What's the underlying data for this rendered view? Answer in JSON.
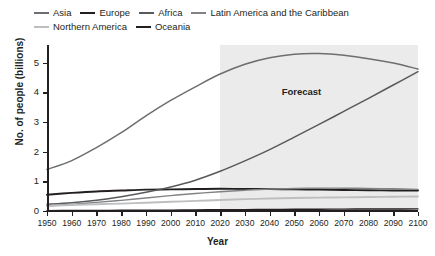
{
  "chart_data": {
    "type": "line",
    "title": "",
    "xlabel": "Year",
    "ylabel": "No. of people (billions)",
    "xlim": [
      1950,
      2100
    ],
    "ylim": [
      0,
      5.6
    ],
    "y_ticks": [
      "0",
      "1",
      "2",
      "3",
      "4",
      "5"
    ],
    "y_tick_values": [
      0,
      1,
      2,
      3,
      4,
      5
    ],
    "x_ticks": [
      "1950",
      "1960",
      "1970",
      "1980",
      "1990",
      "2000",
      "2010",
      "2020",
      "2030",
      "2040",
      "2050",
      "2060",
      "2070",
      "2080",
      "2090",
      "2100"
    ],
    "x_tick_values": [
      1950,
      1960,
      1970,
      1980,
      1990,
      2000,
      2010,
      2020,
      2030,
      2040,
      2050,
      2060,
      2070,
      2080,
      2090,
      2100
    ],
    "grid": false,
    "legend_position": "top-left",
    "annotations": [
      {
        "text": "Forecast",
        "x": 2055,
        "y": 4.05
      }
    ],
    "forecast_region": {
      "label": "Forecast",
      "start": 2020,
      "end": 2100,
      "color": "#ebebeb"
    },
    "x": [
      1950,
      1960,
      1970,
      1980,
      1990,
      2000,
      2010,
      2020,
      2030,
      2040,
      2050,
      2060,
      2070,
      2080,
      2090,
      2100
    ],
    "series": [
      {
        "name": "Asia",
        "color": "#6d6e71",
        "width": 1.5,
        "values": [
          1.4,
          1.7,
          2.14,
          2.64,
          3.21,
          3.73,
          4.19,
          4.62,
          4.95,
          5.17,
          5.29,
          5.31,
          5.25,
          5.14,
          4.99,
          4.79
        ]
      },
      {
        "name": "Europe",
        "color": "#231f20",
        "width": 1.9,
        "values": [
          0.55,
          0.61,
          0.66,
          0.69,
          0.72,
          0.73,
          0.74,
          0.75,
          0.74,
          0.74,
          0.73,
          0.72,
          0.71,
          0.7,
          0.69,
          0.69
        ]
      },
      {
        "name": "Africa",
        "color": "#58595b",
        "width": 1.5,
        "values": [
          0.23,
          0.28,
          0.36,
          0.48,
          0.63,
          0.81,
          1.04,
          1.34,
          1.69,
          2.07,
          2.49,
          2.92,
          3.36,
          3.8,
          4.25,
          4.7
        ]
      },
      {
        "name": "Latin America and the Caribbean",
        "color": "#808285",
        "width": 1.4,
        "values": [
          0.17,
          0.22,
          0.29,
          0.36,
          0.44,
          0.52,
          0.59,
          0.65,
          0.7,
          0.74,
          0.76,
          0.77,
          0.77,
          0.76,
          0.75,
          0.73
        ]
      },
      {
        "name": "Northern America",
        "color": "#bcbec0",
        "width": 1.9,
        "values": [
          0.17,
          0.2,
          0.23,
          0.25,
          0.28,
          0.31,
          0.34,
          0.37,
          0.4,
          0.42,
          0.44,
          0.45,
          0.46,
          0.47,
          0.48,
          0.49
        ]
      },
      {
        "name": "Oceania",
        "color": "#231f20",
        "width": 1.4,
        "values": [
          0.013,
          0.016,
          0.02,
          0.023,
          0.027,
          0.031,
          0.037,
          0.043,
          0.048,
          0.053,
          0.057,
          0.061,
          0.064,
          0.067,
          0.069,
          0.071
        ]
      }
    ]
  }
}
